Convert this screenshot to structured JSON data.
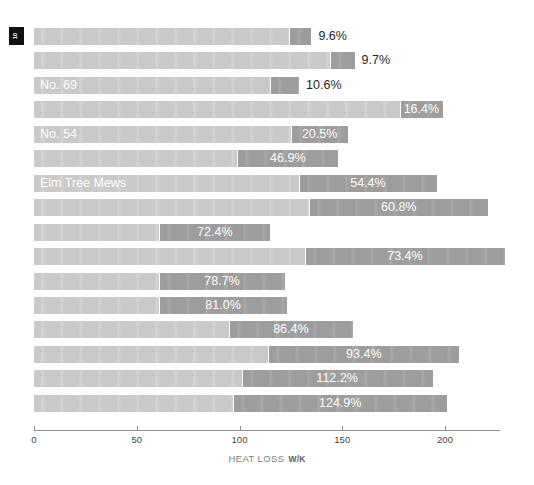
{
  "badge": {
    "text": "10"
  },
  "axis": {
    "title": "HEAT LOSS",
    "units": "W/K",
    "ticks": [
      {
        "label": "0",
        "value": 0
      },
      {
        "label": "50",
        "value": 50
      },
      {
        "label": "100",
        "value": 100
      },
      {
        "label": "150",
        "value": 150
      },
      {
        "label": "200",
        "value": 200
      }
    ]
  },
  "colors": {
    "base": "#c9c9c9",
    "extension": "#9d9d9d",
    "axis": "#8e8e8e",
    "label_inside": "#ffffff",
    "label_outside": "#262626",
    "badge_bg": "#111111"
  },
  "chart_data": {
    "type": "bar",
    "orientation": "horizontal",
    "stacked": true,
    "title": "",
    "xlabel": "HEAT LOSS W/K",
    "ylabel": "",
    "xlim": [
      0,
      232
    ],
    "grid": false,
    "legend": null,
    "series": [
      {
        "name": "Base heat loss",
        "values": [
          124,
          144,
          115,
          178,
          125,
          99,
          129,
          134,
          61,
          132,
          61,
          61,
          95,
          114,
          101,
          97
        ]
      },
      {
        "name": "Additional heat loss",
        "values": [
          11,
          12,
          14,
          21,
          28,
          49,
          67,
          87,
          54,
          97,
          61,
          62,
          60,
          93,
          93,
          104
        ]
      }
    ],
    "rows": [
      {
        "label": "",
        "percent": "9.6%",
        "base": 124,
        "extension": 11,
        "total": 135,
        "label_position": "outside"
      },
      {
        "label": "",
        "percent": "9.7%",
        "base": 144,
        "extension": 12,
        "total": 156,
        "label_position": "outside"
      },
      {
        "label": "No. 69",
        "percent": "10.6%",
        "base": 115,
        "extension": 14,
        "total": 129,
        "label_position": "outside"
      },
      {
        "label": "",
        "percent": "16.4%",
        "base": 178,
        "extension": 21,
        "total": 199,
        "label_position": "inside"
      },
      {
        "label": "No. 54",
        "percent": "20.5%",
        "base": 125,
        "extension": 28,
        "total": 153,
        "label_position": "inside"
      },
      {
        "label": "",
        "percent": "46.9%",
        "base": 99,
        "extension": 49,
        "total": 148,
        "label_position": "inside"
      },
      {
        "label": "Elm Tree Mews",
        "percent": "54.4%",
        "base": 129,
        "extension": 67,
        "total": 196,
        "label_position": "inside"
      },
      {
        "label": "",
        "percent": "60.8%",
        "base": 134,
        "extension": 87,
        "total": 221,
        "label_position": "inside"
      },
      {
        "label": "",
        "percent": "72.4%",
        "base": 61,
        "extension": 54,
        "total": 115,
        "label_position": "inside"
      },
      {
        "label": "",
        "percent": "73.4%",
        "base": 132,
        "extension": 97,
        "total": 229,
        "label_position": "inside"
      },
      {
        "label": "",
        "percent": "78.7%",
        "base": 61,
        "extension": 61,
        "total": 122,
        "label_position": "inside"
      },
      {
        "label": "",
        "percent": "81.0%",
        "base": 61,
        "extension": 62,
        "total": 123,
        "label_position": "inside"
      },
      {
        "label": "",
        "percent": "86.4%",
        "base": 95,
        "extension": 60,
        "total": 155,
        "label_position": "inside"
      },
      {
        "label": "",
        "percent": "93.4%",
        "base": 114,
        "extension": 93,
        "total": 207,
        "label_position": "inside"
      },
      {
        "label": "",
        "percent": "112.2%",
        "base": 101,
        "extension": 93,
        "total": 194,
        "label_position": "inside"
      },
      {
        "label": "",
        "percent": "124.9%",
        "base": 97,
        "extension": 104,
        "total": 201,
        "label_position": "inside"
      }
    ]
  }
}
